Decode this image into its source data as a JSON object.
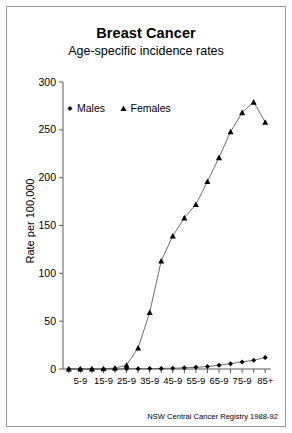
{
  "figure": {
    "title": "Breast Cancer",
    "subtitle": "Age-specific incidence rates",
    "source_note": "NSW Central Cancer Registry 1988-92"
  },
  "chart_data": {
    "type": "line",
    "title": "Breast Cancer",
    "subtitle": "Age-specific incidence rates",
    "xlabel": "",
    "ylabel": "Rate per 100,000",
    "ylim": [
      0,
      300
    ],
    "yticks": [
      0,
      50,
      100,
      150,
      200,
      250,
      300
    ],
    "ytick_labels": [
      "0",
      "50",
      "100",
      "150",
      "200",
      "250",
      "300"
    ],
    "grid": false,
    "legend_position": "upper-left-inside",
    "categories": [
      "0-4",
      "5-9",
      "10-14",
      "15-9",
      "20-24",
      "25-9",
      "30-34",
      "35-9",
      "40-44",
      "45-9",
      "50-54",
      "55-9",
      "60-64",
      "65-9",
      "70-74",
      "75-9",
      "80-84",
      "85+"
    ],
    "xtick_labels_shown": [
      "",
      "5-9",
      "",
      "15-9",
      "",
      "25-9",
      "",
      "35-9",
      "",
      "45-9",
      "",
      "55-9",
      "",
      "65-9",
      "",
      "75-9",
      "",
      "85+"
    ],
    "series": [
      {
        "name": "Males",
        "marker": "filled-diamond",
        "values": [
          0,
          0,
          0,
          0,
          0,
          0.2,
          0.3,
          0.4,
          0.6,
          0.8,
          1.2,
          1.8,
          2.6,
          4.0,
          5.6,
          7.4,
          9.2,
          12.0
        ]
      },
      {
        "name": "Females",
        "marker": "filled-triangle",
        "values": [
          0,
          0,
          0,
          0.2,
          1.0,
          4.0,
          22.0,
          59.0,
          113.0,
          139.0,
          158.0,
          172.0,
          196.0,
          221.0,
          248.0,
          268.0,
          279.0,
          258.0
        ]
      }
    ]
  },
  "legend": {
    "entries": [
      {
        "label": "Males",
        "marker": "filled-diamond"
      },
      {
        "label": "Females",
        "marker": "filled-triangle"
      }
    ]
  }
}
